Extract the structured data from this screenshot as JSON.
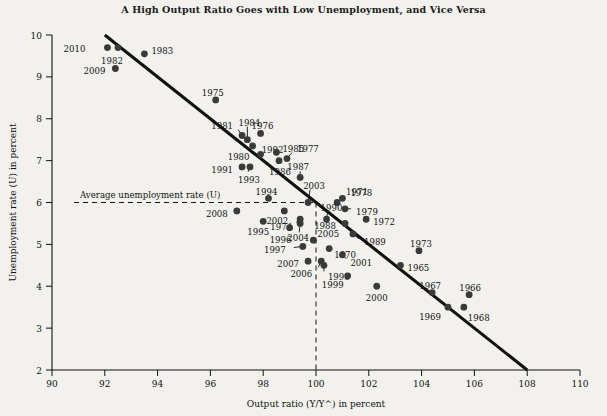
{
  "chart_data": {
    "type": "scatter",
    "title": "A High Output Ratio Goes with Low Unemployment, and Vice Versa",
    "xlabel": "Output ratio (Y/Y^) in percent",
    "ylabel": "Unemployment rate (U) in percent",
    "xlim": [
      90,
      110
    ],
    "ylim": [
      2,
      10
    ],
    "xticks": [
      90,
      92,
      94,
      96,
      98,
      100,
      102,
      104,
      106,
      108,
      110
    ],
    "yticks": [
      2,
      3,
      4,
      5,
      6,
      7,
      8,
      9,
      10
    ],
    "grid": false,
    "legend": null,
    "annotations": {
      "average_unemployment_label": "Average unemployment rate (U)",
      "average_unemployment_value": 6,
      "potential_output_value": 100
    },
    "trend_line": {
      "x1": 92.0,
      "y1": 10.0,
      "x2": 108.0,
      "y2": 2.0
    },
    "points": [
      {
        "label": "2010",
        "x": 92.1,
        "y": 9.7,
        "lx": -22,
        "ly": 1,
        "anchor": "end"
      },
      {
        "label": "1982",
        "x": 92.5,
        "y": 9.7,
        "lx": -6,
        "ly": 13,
        "anchor": "middle"
      },
      {
        "label": "2009",
        "x": 92.4,
        "y": 9.2,
        "lx": -10,
        "ly": 2,
        "anchor": "end"
      },
      {
        "label": "1983",
        "x": 93.5,
        "y": 9.55,
        "lx": 7,
        "ly": -3,
        "anchor": "start"
      },
      {
        "label": "1975",
        "x": 96.2,
        "y": 8.45,
        "lx": -3,
        "ly": -7,
        "anchor": "middle"
      },
      {
        "label": "1984",
        "x": 97.4,
        "y": 7.5,
        "lx": 2,
        "ly": -17,
        "anchor": "middle",
        "leader": [
          0,
          -13
        ]
      },
      {
        "label": "1981",
        "x": 97.2,
        "y": 7.6,
        "lx": -9,
        "ly": -10,
        "anchor": "end",
        "leader": [
          -4,
          -6
        ]
      },
      {
        "label": "1976",
        "x": 97.9,
        "y": 7.65,
        "lx": 2,
        "ly": -7,
        "anchor": "middle"
      },
      {
        "label": "1992",
        "x": 97.6,
        "y": 7.35,
        "lx": 9,
        "ly": 4,
        "anchor": "start"
      },
      {
        "label": "1980",
        "x": 97.9,
        "y": 7.15,
        "lx": -11,
        "ly": 3,
        "anchor": "end",
        "leader": [
          -7,
          0
        ]
      },
      {
        "label": "1985",
        "x": 98.5,
        "y": 7.2,
        "lx": 6,
        "ly": -3,
        "anchor": "start"
      },
      {
        "label": "1977",
        "x": 98.9,
        "y": 7.05,
        "lx": 10,
        "ly": -10,
        "anchor": "start",
        "leader": [
          5,
          -6
        ]
      },
      {
        "label": "1991",
        "x": 97.2,
        "y": 6.85,
        "lx": -9,
        "ly": 3,
        "anchor": "end"
      },
      {
        "label": "1993",
        "x": 97.5,
        "y": 6.85,
        "lx": -1,
        "ly": 13,
        "anchor": "middle",
        "leader": [
          -2,
          5
        ]
      },
      {
        "label": "1986",
        "x": 98.6,
        "y": 7.0,
        "lx": 1,
        "ly": 11,
        "anchor": "middle"
      },
      {
        "label": "1987",
        "x": 99.4,
        "y": 6.6,
        "lx": -2,
        "ly": -10,
        "anchor": "middle",
        "leader": [
          0,
          -6
        ]
      },
      {
        "label": "2003",
        "x": 99.7,
        "y": 6.0,
        "lx": 6,
        "ly": -17,
        "anchor": "middle",
        "leader": [
          2,
          -13
        ]
      },
      {
        "label": "1971",
        "x": 100.8,
        "y": 6.0,
        "lx": 9,
        "ly": -11,
        "anchor": "start"
      },
      {
        "label": "1990",
        "x": 100.4,
        "y": 5.6,
        "lx": 5,
        "ly": -11,
        "anchor": "middle",
        "leader": [
          1,
          -7
        ]
      },
      {
        "label": "1978",
        "x": 101.0,
        "y": 6.1,
        "lx": 8,
        "ly": -5,
        "anchor": "start"
      },
      {
        "label": "1979",
        "x": 101.1,
        "y": 5.85,
        "lx": 11,
        "ly": 3,
        "anchor": "start",
        "leader": [
          6,
          0
        ]
      },
      {
        "label": "1994",
        "x": 98.2,
        "y": 6.1,
        "lx": -2,
        "ly": -6,
        "anchor": "middle"
      },
      {
        "label": "2002",
        "x": 98.8,
        "y": 5.8,
        "lx": -7,
        "ly": 10,
        "anchor": "middle"
      },
      {
        "label": "2008",
        "x": 97.0,
        "y": 5.8,
        "lx": -9,
        "ly": 3,
        "anchor": "end"
      },
      {
        "label": "1974",
        "x": 99.4,
        "y": 5.6,
        "lx": -8,
        "ly": 8,
        "anchor": "end",
        "leader": [
          -4,
          3
        ]
      },
      {
        "label": "1988",
        "x": 101.1,
        "y": 5.5,
        "lx": -9,
        "ly": 3,
        "anchor": "end",
        "leader": [
          -5,
          0
        ]
      },
      {
        "label": "1972",
        "x": 101.9,
        "y": 5.6,
        "lx": 7,
        "ly": 3,
        "anchor": "start"
      },
      {
        "label": "1995",
        "x": 98.0,
        "y": 5.55,
        "lx": -5,
        "ly": 11,
        "anchor": "middle"
      },
      {
        "label": "2005",
        "x": 99.9,
        "y": 5.1,
        "lx": 4,
        "ly": -6,
        "anchor": "start"
      },
      {
        "label": "1989",
        "x": 101.4,
        "y": 5.25,
        "lx": 11,
        "ly": 8,
        "anchor": "start",
        "leader": [
          6,
          5
        ]
      },
      {
        "label": "1996",
        "x": 99.0,
        "y": 5.4,
        "lx": -9,
        "ly": 12,
        "anchor": "middle"
      },
      {
        "label": "2004",
        "x": 99.4,
        "y": 5.5,
        "lx": -2,
        "ly": 15,
        "anchor": "middle",
        "leader": [
          -1,
          9
        ]
      },
      {
        "label": "1973",
        "x": 103.9,
        "y": 4.85,
        "lx": 2,
        "ly": -7,
        "anchor": "middle"
      },
      {
        "label": "1997",
        "x": 99.5,
        "y": 4.95,
        "lx": -17,
        "ly": 4,
        "anchor": "end",
        "leader": [
          -9,
          1
        ]
      },
      {
        "label": "1970",
        "x": 100.5,
        "y": 4.9,
        "lx": 5,
        "ly": 6,
        "anchor": "start"
      },
      {
        "label": "1965",
        "x": 103.2,
        "y": 4.5,
        "lx": 7,
        "ly": 3,
        "anchor": "start"
      },
      {
        "label": "2007",
        "x": 99.7,
        "y": 4.6,
        "lx": -9,
        "ly": 3,
        "anchor": "end"
      },
      {
        "label": "2001",
        "x": 101.0,
        "y": 4.75,
        "lx": 8,
        "ly": 8,
        "anchor": "start",
        "leader": [
          4,
          4
        ]
      },
      {
        "label": "2006",
        "x": 100.2,
        "y": 4.6,
        "lx": -9,
        "ly": 13,
        "anchor": "end",
        "leader": [
          -3,
          6
        ]
      },
      {
        "label": "1998",
        "x": 100.3,
        "y": 4.5,
        "lx": 4,
        "ly": 12,
        "anchor": "start",
        "leader": [
          0,
          6
        ]
      },
      {
        "label": "1999",
        "x": 101.2,
        "y": 4.25,
        "lx": -4,
        "ly": 9,
        "anchor": "end"
      },
      {
        "label": "1967",
        "x": 104.4,
        "y": 3.85,
        "lx": -2,
        "ly": -7,
        "anchor": "middle"
      },
      {
        "label": "1966",
        "x": 105.8,
        "y": 3.8,
        "lx": 1,
        "ly": -7,
        "anchor": "middle"
      },
      {
        "label": "2000",
        "x": 102.3,
        "y": 4.0,
        "lx": 0,
        "ly": 12,
        "anchor": "middle"
      },
      {
        "label": "1969",
        "x": 105.0,
        "y": 3.5,
        "lx": -7,
        "ly": 10,
        "anchor": "end"
      },
      {
        "label": "1968",
        "x": 105.6,
        "y": 3.5,
        "lx": 4,
        "ly": 11,
        "anchor": "start"
      }
    ]
  }
}
